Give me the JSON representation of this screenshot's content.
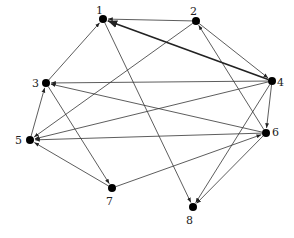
{
  "graph": {
    "type": "directed",
    "nodes": [
      {
        "id": "1",
        "label": "1",
        "x": 103,
        "y": 19,
        "lx": 96,
        "ly": 14
      },
      {
        "id": "2",
        "label": "2",
        "x": 196,
        "y": 21,
        "lx": 190,
        "ly": 15
      },
      {
        "id": "3",
        "label": "3",
        "x": 46,
        "y": 83,
        "lx": 32,
        "ly": 87
      },
      {
        "id": "4",
        "label": "4",
        "x": 272,
        "y": 81,
        "lx": 277,
        "ly": 86
      },
      {
        "id": "5",
        "label": "5",
        "x": 30,
        "y": 140,
        "lx": 15,
        "ly": 144
      },
      {
        "id": "6",
        "label": "6",
        "x": 266,
        "y": 133,
        "lx": 272,
        "ly": 136
      },
      {
        "id": "7",
        "label": "7",
        "x": 112,
        "y": 188,
        "lx": 106,
        "ly": 205
      },
      {
        "id": "8",
        "label": "8",
        "x": 193,
        "y": 207,
        "lx": 186,
        "ly": 224
      }
    ],
    "edges": [
      {
        "from": "2",
        "to": "1",
        "thick": false
      },
      {
        "from": "4",
        "to": "1",
        "thick": true
      },
      {
        "from": "3",
        "to": "1",
        "thick": false
      },
      {
        "from": "1",
        "to": "8",
        "thick": false
      },
      {
        "from": "2",
        "to": "5",
        "thick": false
      },
      {
        "from": "2",
        "to": "4",
        "thick": false
      },
      {
        "from": "6",
        "to": "2",
        "thick": false
      },
      {
        "from": "4",
        "to": "3",
        "thick": false
      },
      {
        "from": "6",
        "to": "3",
        "thick": false
      },
      {
        "from": "3",
        "to": "7",
        "thick": false
      },
      {
        "from": "5",
        "to": "3",
        "thick": false
      },
      {
        "from": "4",
        "to": "5",
        "thick": false
      },
      {
        "from": "6",
        "to": "5",
        "thick": false
      },
      {
        "from": "7",
        "to": "5",
        "thick": false
      },
      {
        "from": "7",
        "to": "6",
        "thick": false
      },
      {
        "from": "4",
        "to": "6",
        "thick": false
      },
      {
        "from": "4",
        "to": "8",
        "thick": false
      },
      {
        "from": "6",
        "to": "8",
        "thick": false
      }
    ]
  }
}
